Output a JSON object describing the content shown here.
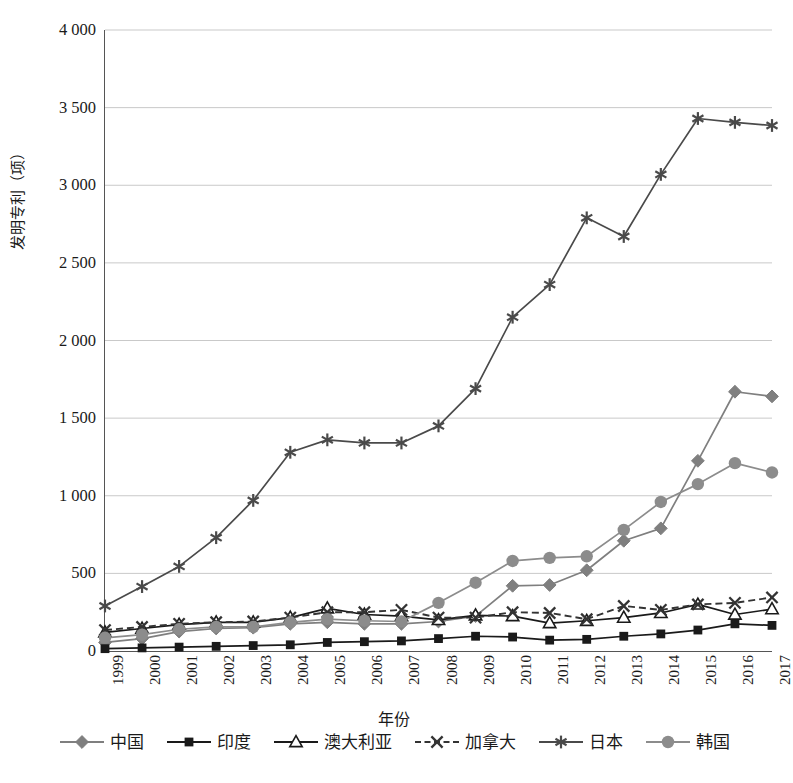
{
  "chart": {
    "type": "line",
    "y_axis_title": "发明专利（项）",
    "x_axis_title": "年份",
    "y_ticks": [
      "0",
      "500",
      "1 000",
      "1 500",
      "2 000",
      "2 500",
      "3 000",
      "3 500",
      "4 000"
    ],
    "grid": true,
    "legend_position": "bottom"
  },
  "chart_data": {
    "type": "line",
    "title": "",
    "xlabel": "年份",
    "ylabel": "发明专利（项）",
    "ylim": [
      0,
      4000
    ],
    "ytick_values": [
      0,
      500,
      1000,
      1500,
      2000,
      2500,
      3000,
      3500,
      4000
    ],
    "ytick_labels": [
      "0",
      "500",
      "1 000",
      "1 500",
      "2 000",
      "2 500",
      "3 000",
      "3 500",
      "4 000"
    ],
    "grid": true,
    "legend_position": "bottom",
    "categories": [
      "1999",
      "2000",
      "2001",
      "2002",
      "2003",
      "2004",
      "2005",
      "2006",
      "2007",
      "2008",
      "2009",
      "2010",
      "2011",
      "2012",
      "2013",
      "2014",
      "2015",
      "2016",
      "2017"
    ],
    "series": [
      {
        "name": "中国",
        "marker": "diamond",
        "line_style": "solid",
        "color": "#7f7f7f",
        "values": [
          55,
          80,
          125,
          145,
          150,
          175,
          185,
          175,
          175,
          190,
          225,
          420,
          425,
          520,
          710,
          790,
          1225,
          1670,
          1640
        ]
      },
      {
        "name": "印度",
        "marker": "square",
        "line_style": "solid",
        "color": "#1a1a1a",
        "values": [
          15,
          20,
          25,
          30,
          35,
          40,
          55,
          60,
          65,
          80,
          95,
          90,
          70,
          75,
          95,
          110,
          135,
          175,
          165
        ]
      },
      {
        "name": "澳大利亚",
        "marker": "triangle-open",
        "line_style": "solid",
        "color": "#1a1a1a",
        "values": [
          120,
          145,
          170,
          185,
          185,
          215,
          275,
          235,
          225,
          200,
          230,
          225,
          180,
          195,
          215,
          245,
          300,
          235,
          270
        ]
      },
      {
        "name": "加拿大",
        "marker": "x",
        "line_style": "dashed",
        "color": "#333333",
        "values": [
          135,
          155,
          175,
          185,
          190,
          215,
          250,
          250,
          265,
          215,
          215,
          250,
          245,
          205,
          290,
          265,
          300,
          310,
          345
        ]
      },
      {
        "name": "日本",
        "marker": "asterisk",
        "line_style": "solid",
        "color": "#4a4a4a",
        "values": [
          290,
          415,
          545,
          730,
          970,
          1280,
          1360,
          1340,
          1340,
          1450,
          1690,
          2150,
          2360,
          2790,
          2670,
          3070,
          3430,
          3405,
          3385
        ]
      },
      {
        "name": "韩国",
        "marker": "circle",
        "line_style": "solid",
        "color": "#8c8c8c",
        "values": [
          85,
          105,
          140,
          155,
          155,
          185,
          205,
          195,
          190,
          310,
          440,
          580,
          600,
          610,
          780,
          960,
          1075,
          1210,
          1150
        ]
      }
    ]
  }
}
